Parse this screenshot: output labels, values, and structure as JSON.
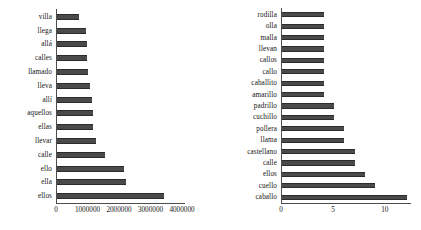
{
  "figure": {
    "background_color": "#ffffff",
    "bar_color": "#4a4a4a",
    "axis_color": "#4d4d4d",
    "text_color": "#141414"
  },
  "chart_data": [
    {
      "type": "bar",
      "orientation": "horizontal",
      "title": "",
      "subtitle": "",
      "xlabel": "",
      "ylabel": "",
      "xlim": [
        0,
        4000000
      ],
      "xticks": [
        0,
        1000000,
        2000000,
        3000000,
        4000000
      ],
      "xticklabels": [
        "0",
        "1000000",
        "2000000",
        "3000000",
        "4000000"
      ],
      "grid": false,
      "legend": null,
      "categories": [
        "villa",
        "llega",
        "allá",
        "calles",
        "llamado",
        "lleva",
        "allí",
        "aquellos",
        "ellas",
        "llevar",
        "calle",
        "ello",
        "ella",
        "ellos"
      ],
      "values": [
        690000,
        930000,
        950000,
        960000,
        970000,
        1060000,
        1110000,
        1130000,
        1150000,
        1230000,
        1520000,
        2130000,
        2200000,
        3400000
      ]
    },
    {
      "type": "bar",
      "orientation": "horizontal",
      "title": "",
      "subtitle": "",
      "xlabel": "",
      "ylabel": "",
      "xlim": [
        0,
        13
      ],
      "xticks": [
        0,
        5,
        10
      ],
      "xticklabels": [
        "0",
        "5",
        "10"
      ],
      "grid": false,
      "legend": null,
      "categories": [
        "rodilla",
        "olla",
        "malla",
        "llevan",
        "callos",
        "callo",
        "caballito",
        "amarillo",
        "padrillo",
        "cuchillo",
        "pollera",
        "llama",
        "castellano",
        "calle",
        "ellos",
        "cuello",
        "caballo"
      ],
      "values": [
        4,
        4,
        4,
        4,
        4,
        4,
        4,
        4,
        5,
        5,
        6,
        6,
        7,
        7,
        8,
        9,
        12
      ]
    }
  ]
}
